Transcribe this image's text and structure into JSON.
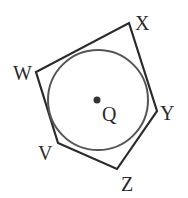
{
  "figure": {
    "type": "pentagon circumscribed about circle",
    "center_label": "Q",
    "vertices": [
      {
        "label": "X",
        "x": 129,
        "y": 23,
        "lx": 135,
        "ly": 30
      },
      {
        "label": "Y",
        "x": 157,
        "y": 111,
        "lx": 160,
        "ly": 120
      },
      {
        "label": "Z",
        "x": 117,
        "y": 169,
        "lx": 121,
        "ly": 190
      },
      {
        "label": "V",
        "x": 58,
        "y": 143,
        "lx": 38,
        "ly": 160
      },
      {
        "label": "W",
        "x": 36,
        "y": 72,
        "lx": 14,
        "ly": 80
      }
    ],
    "circle": {
      "cx": 98,
      "cy": 100,
      "r": 50
    },
    "center": {
      "x": 97,
      "y": 100,
      "lx": 102,
      "ly": 120
    },
    "stroke_color": "#2a2a2a",
    "circle_color": "#555555"
  }
}
